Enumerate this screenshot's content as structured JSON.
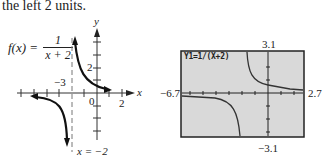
{
  "intro_text": "the left 2 units.",
  "left_graph": {
    "function_lhs": "f(x) =",
    "function_numerator": "1",
    "function_denominator": "x + 2",
    "asymptote_label": "x = −2",
    "x_axis_label": "x",
    "y_axis_label": "y",
    "tick_labels": {
      "x_neg3": "−3",
      "x_0": "0",
      "x_2": "2",
      "y_2": "2"
    }
  },
  "calculator": {
    "equation": "Y1=1/(X+2)",
    "ymax": "3.1",
    "ymin": "−3.1",
    "xmin": "−6.7",
    "xmax": "2.7",
    "screen_color": "#d9d9d9",
    "border_color": "#222222"
  }
}
